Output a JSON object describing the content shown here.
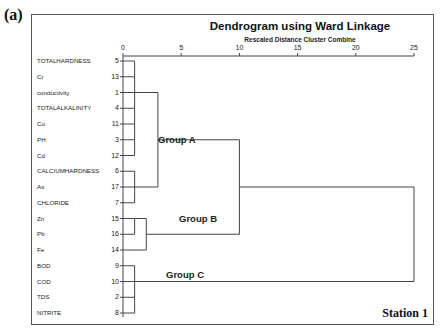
{
  "panel_label": "(a)",
  "chart_data": {
    "type": "dendrogram",
    "title": "Dendrogram using Ward Linkage",
    "subtitle": "Rescaled Distance Cluster Combine",
    "xlabel": "Rescaled Distance Cluster Combine",
    "xlim": [
      0,
      25
    ],
    "x_ticks": [
      "0",
      "5",
      "10",
      "15",
      "20",
      "25"
    ],
    "leaves": [
      {
        "label": "TOTALHARDNESS",
        "id": "5"
      },
      {
        "label": "Cr",
        "id": "13"
      },
      {
        "label": "conductivity",
        "id": "1"
      },
      {
        "label": "TOTALALKALINITY",
        "id": "4"
      },
      {
        "label": "Cu",
        "id": "11"
      },
      {
        "label": "PH",
        "id": "3"
      },
      {
        "label": "Cd",
        "id": "12"
      },
      {
        "label": "CALCIUMHARDNESS",
        "id": "6"
      },
      {
        "label": "As",
        "id": "17"
      },
      {
        "label": "CHLORIDE",
        "id": "7"
      },
      {
        "label": "Zn",
        "id": "15"
      },
      {
        "label": "Pb",
        "id": "16"
      },
      {
        "label": "Fe",
        "id": "14"
      },
      {
        "label": "BOD",
        "id": "9"
      },
      {
        "label": "COD",
        "id": "10"
      },
      {
        "label": "TDS",
        "id": "2"
      },
      {
        "label": "NITRITE",
        "id": "8"
      }
    ],
    "merges": [
      {
        "members": [
          "5",
          "13",
          "1",
          "4",
          "11",
          "3",
          "12"
        ],
        "distance": 1
      },
      {
        "members": [
          "6",
          "17",
          "7"
        ],
        "distance": 1
      },
      {
        "members": [
          "15",
          "16"
        ],
        "distance": 1
      },
      {
        "members": [
          "15",
          "16",
          "14"
        ],
        "distance": 2
      },
      {
        "members": [
          "9",
          "10",
          "2",
          "8"
        ],
        "distance": 1
      },
      {
        "members": [
          "5",
          "13",
          "1",
          "4",
          "11",
          "3",
          "12",
          "6",
          "17",
          "7"
        ],
        "distance": 3,
        "group": "Group A"
      },
      {
        "members": [
          "Group A",
          "Group B"
        ],
        "distance": 10
      },
      {
        "members": [
          "Group A",
          "Group B",
          "Group C"
        ],
        "distance": 25
      }
    ],
    "groups": [
      {
        "name": "Group A",
        "members": [
          "TOTALHARDNESS",
          "Cr",
          "conductivity",
          "TOTALALKALINITY",
          "Cu",
          "PH",
          "Cd",
          "CALCIUMHARDNESS",
          "As",
          "CHLORIDE"
        ]
      },
      {
        "name": "Group B",
        "members": [
          "Zn",
          "Pb",
          "Fe"
        ]
      },
      {
        "name": "Group C",
        "members": [
          "BOD",
          "COD",
          "TDS",
          "NITRITE"
        ]
      }
    ],
    "annotation": "Station 1"
  },
  "group_labels": [
    "Group A",
    "Group B",
    "Group C"
  ],
  "station_label": "Station 1"
}
